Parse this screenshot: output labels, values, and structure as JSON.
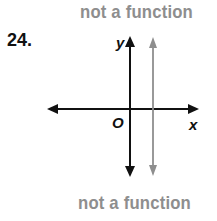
{
  "problem": {
    "number": "24.",
    "top_label": "not a function",
    "bottom_label": "not a function"
  },
  "graph": {
    "x_axis_label": "x",
    "y_axis_label": "y",
    "origin_label": "O",
    "vertical_line": {
      "description": "vertical line x = c (c > 0)",
      "color": "#8e8e8e"
    },
    "axis_color": "#111111"
  }
}
